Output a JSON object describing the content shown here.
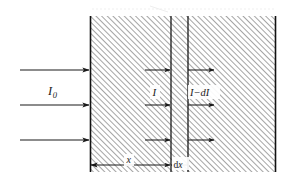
{
  "figure": {
    "canvas": {
      "width": 290,
      "height": 184,
      "background": "#ffffff"
    },
    "block": {
      "name": "absorbing-medium",
      "x": 90,
      "y": 16,
      "width": 186,
      "height": 156,
      "hatch_angle_deg": 45,
      "hatch_spacing": 4,
      "hatch_color": "#5a5a5a",
      "border_color": "#111111"
    },
    "internal_lines": [
      {
        "name": "slab-left-boundary",
        "x": 171
      },
      {
        "name": "slab-right-boundary",
        "x": 188
      }
    ],
    "labels": {
      "incident_intensity": "I",
      "incident_intensity_subscript": "0",
      "intensity_at_x": "I",
      "intensity_after_slab": "I−d",
      "intensity_after_slab_tail": "I",
      "depth": "x",
      "slab_thickness_prefix": "d",
      "slab_thickness_var": "x"
    },
    "arrow_rows_y": [
      70,
      105,
      140
    ],
    "arrow_groups": [
      {
        "name": "incident-beam-arrows",
        "x_start": 20,
        "x_end": 90
      },
      {
        "name": "intensity-at-x-arrows",
        "x_start": 145,
        "x_end": 171
      },
      {
        "name": "transmitted-beam-arrows",
        "x_start": 188,
        "x_end": 214
      }
    ],
    "dimension_line": {
      "name": "depth-dimension",
      "x_start": 90,
      "x_end": 171,
      "y": 165
    },
    "colors": {
      "stroke": "#1a1a1a",
      "hatch": "#5a5a5a",
      "background": "#ffffff",
      "artifact": "#d8d8d8"
    }
  }
}
